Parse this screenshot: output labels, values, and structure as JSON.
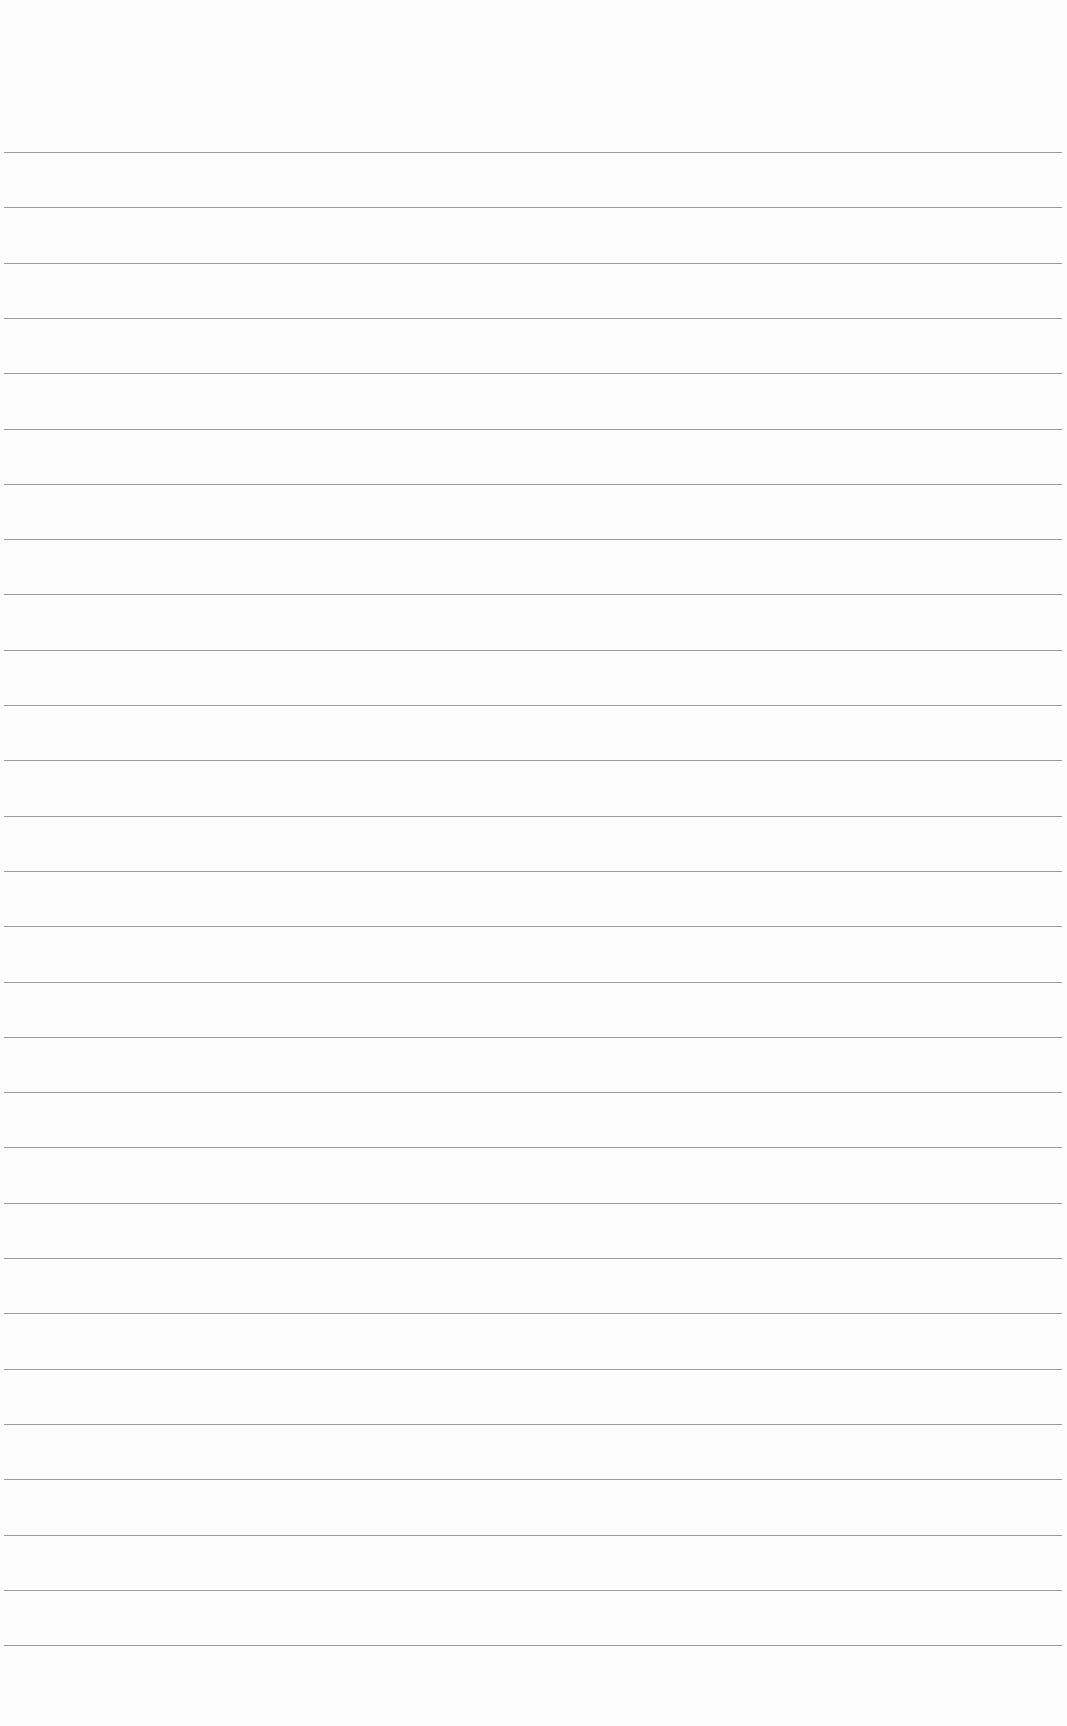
{
  "page": {
    "type": "blank lined paper",
    "background_color": "#fdfdfd",
    "line_color": "#8a8a8a",
    "line_count": 28,
    "first_line_y": 152,
    "line_spacing": 55.3,
    "line_left": 4,
    "line_width": 1058
  }
}
